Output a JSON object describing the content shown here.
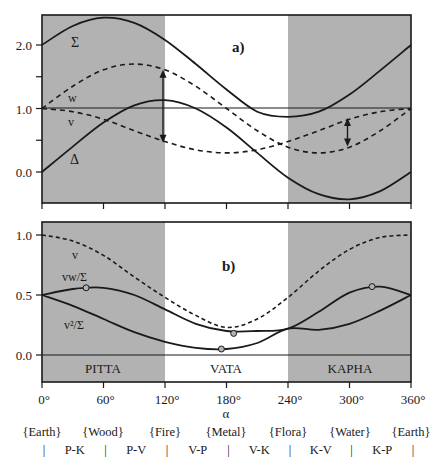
{
  "chart_data": [
    {
      "panel": "a)",
      "type": "line",
      "xlabel": "α",
      "x_ticks": [
        "0°",
        "60°",
        "120°",
        "180°",
        "240°",
        "300°",
        "360°"
      ],
      "xlim": [
        0,
        360
      ],
      "ylim": [
        -0.5,
        2.5
      ],
      "y_ticks": [
        "0.0",
        "1.0",
        "2.0"
      ],
      "y_minor_ticks": [
        0.5,
        1.5
      ],
      "x": [
        0,
        30,
        60,
        90,
        120,
        150,
        180,
        210,
        240,
        270,
        300,
        330,
        360
      ],
      "series": [
        {
          "name": "Σ",
          "style": "solid",
          "values": [
            2.0,
            2.3,
            2.43,
            2.35,
            2.08,
            1.7,
            1.3,
            0.95,
            0.87,
            0.95,
            1.22,
            1.6,
            2.0
          ]
        },
        {
          "name": "w",
          "style": "dashed",
          "values": [
            1.0,
            1.35,
            1.61,
            1.7,
            1.61,
            1.35,
            1.0,
            0.65,
            0.39,
            0.3,
            0.39,
            0.65,
            1.0
          ]
        },
        {
          "name": "v",
          "style": "dashed",
          "values": [
            1.0,
            0.95,
            0.83,
            0.65,
            0.48,
            0.35,
            0.3,
            0.35,
            0.48,
            0.65,
            0.83,
            0.95,
            1.0
          ]
        },
        {
          "name": "Δ",
          "style": "solid",
          "values": [
            0.0,
            0.4,
            0.78,
            1.05,
            1.13,
            1.0,
            0.7,
            0.3,
            -0.09,
            -0.35,
            -0.43,
            -0.3,
            0.0
          ]
        }
      ],
      "reference_line": 1.0,
      "annotations": [
        {
          "type": "double-arrow",
          "x": 120,
          "from": "w",
          "to": "v"
        },
        {
          "type": "double-arrow",
          "x": 300,
          "from": "v",
          "to": "w"
        }
      ],
      "shaded_regions": [
        [
          0,
          120
        ],
        [
          240,
          360
        ]
      ]
    },
    {
      "panel": "b)",
      "type": "line",
      "xlabel": "α",
      "x_ticks": [
        "0°",
        "60°",
        "120°",
        "180°",
        "240°",
        "300°",
        "360°"
      ],
      "xlim": [
        0,
        360
      ],
      "ylim": [
        -0.22,
        1.1
      ],
      "y_ticks": [
        "0.0",
        "0.5",
        "1.0"
      ],
      "x": [
        0,
        30,
        60,
        90,
        120,
        150,
        180,
        210,
        240,
        270,
        300,
        330,
        360
      ],
      "series": [
        {
          "name": "v",
          "style": "dashed",
          "values": [
            1.0,
            0.95,
            0.83,
            0.65,
            0.48,
            0.33,
            0.23,
            0.3,
            0.48,
            0.7,
            0.88,
            0.98,
            1.0
          ]
        },
        {
          "name": "vw/Σ",
          "style": "solid",
          "values": [
            0.5,
            0.55,
            0.56,
            0.5,
            0.38,
            0.26,
            0.2,
            0.2,
            0.22,
            0.36,
            0.52,
            0.57,
            0.5
          ]
        },
        {
          "name": "v²/Σ",
          "style": "solid",
          "values": [
            0.5,
            0.41,
            0.3,
            0.19,
            0.11,
            0.06,
            0.05,
            0.1,
            0.22,
            0.21,
            0.26,
            0.37,
            0.5
          ]
        }
      ],
      "markers": [
        {
          "series": "vw/Σ",
          "x": 43,
          "y": 0.56
        },
        {
          "series": "vw/Σ",
          "x": 187,
          "y": 0.18
        },
        {
          "series": "v²/Σ",
          "x": 175,
          "y": 0.05
        },
        {
          "series": "vw/Σ",
          "x": 322,
          "y": 0.57
        }
      ],
      "region_labels": [
        "PITTA",
        "VATA",
        "KAPHA"
      ],
      "shaded_regions": [
        [
          0,
          120
        ],
        [
          240,
          360
        ]
      ]
    }
  ],
  "panel_a": {
    "label": "a)",
    "labels": {
      "sigma": "Σ",
      "w": "w",
      "v": "v",
      "delta": "Δ"
    },
    "y_ticks": [
      "2.0",
      "1.0",
      "0.0"
    ]
  },
  "panel_b": {
    "label": "b)",
    "labels": {
      "v": "v",
      "vw": "vw/Σ",
      "v2": "v²/Σ"
    },
    "y_ticks": [
      "1.0",
      "0.5",
      "0.0"
    ],
    "regions": [
      "PITTA",
      "VATA",
      "KAPHA"
    ]
  },
  "x_axis": {
    "ticks": [
      "0°",
      "60°",
      "120°",
      "180°",
      "240°",
      "300°",
      "360°"
    ],
    "label": "α",
    "elements": [
      "{Earth}",
      "{Wood}",
      "{Fire}",
      "{Metal}",
      "{Flora}",
      "{Water}",
      "{Earth}"
    ],
    "transitions": [
      "P-K",
      "P-V",
      "V-P",
      "V-K",
      "K-V",
      "K-P"
    ],
    "separator": "|"
  },
  "colors": {
    "shade": "#b2b2b2",
    "line": "#1a1a1a",
    "background": "#ffffff"
  }
}
